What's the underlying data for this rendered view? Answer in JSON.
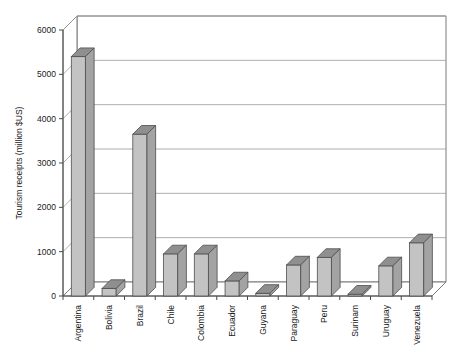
{
  "chart_data": {
    "type": "bar",
    "title": "",
    "subtitle": "",
    "xlabel": "",
    "ylabel": "Tourism receipts (million $US)",
    "categories": [
      "Argentina",
      "Bolivia",
      "Brazil",
      "Chile",
      "Colombia",
      "Ecuador",
      "Guyana",
      "Paraguay",
      "Peru",
      "Surinam",
      "Uruguay",
      "Venezuela"
    ],
    "values": [
      5400,
      170,
      3650,
      950,
      950,
      340,
      60,
      700,
      870,
      40,
      680,
      1200
    ],
    "ytick_labels": [
      "0",
      "1000",
      "2000",
      "3000",
      "4000",
      "5000",
      "6000"
    ],
    "ytick_values": [
      0,
      1000,
      2000,
      3000,
      4000,
      5000,
      6000
    ],
    "ylim": [
      0,
      6000
    ],
    "grid": true,
    "grid_axis": "y",
    "legend": false,
    "legend_position": "none",
    "style": "3d-bars",
    "colors": {
      "bar_front": "#c3c3c3",
      "bar_top": "#8f8f8f",
      "bar_side": "#a3a3a3",
      "bar_edge": "#4d4d4d",
      "grid": "#9a9a9a",
      "axis": "#4a4a4a",
      "background": "#ffffff",
      "text": "#1a1a1a"
    }
  },
  "axis": {
    "y_title": "Tourism receipts (million $US)"
  }
}
